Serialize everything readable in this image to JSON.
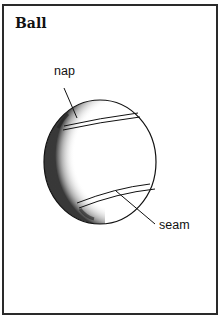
{
  "title": "Ball",
  "labels": {
    "nap": "nap",
    "seam": "seam"
  },
  "colors": {
    "ink": "#111111",
    "background": "#ffffff",
    "border": "#2a2a2a"
  }
}
